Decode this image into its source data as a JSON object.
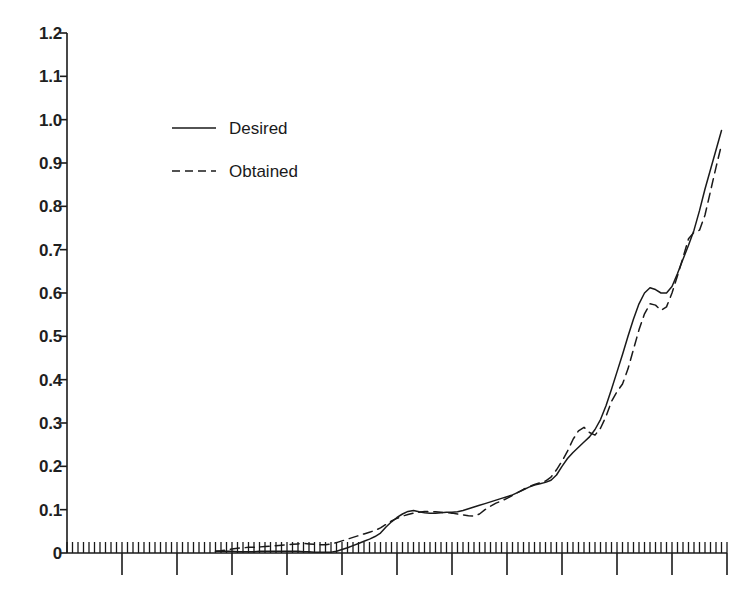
{
  "chart_data": {
    "type": "line",
    "title": "",
    "subtitle": "",
    "xlabel": "",
    "ylabel": "",
    "xlim": [
      0,
      120
    ],
    "ylim": [
      0,
      1.2
    ],
    "grid": false,
    "legend_position": "upper-left-inside",
    "y_ticks": [
      0,
      0.1,
      0.2,
      0.3,
      0.4,
      0.5,
      0.6,
      0.7,
      0.8,
      0.9,
      1.0,
      1.1,
      1.2
    ],
    "y_tick_labels": [
      "0",
      "0.1",
      "0.2",
      "0.3",
      "0.4",
      "0.5",
      "0.6",
      "0.7",
      "0.8",
      "0.9",
      "1.0",
      "1.1",
      "1.2"
    ],
    "x_ticks_major_count": 12,
    "x_minor_per_major": 10,
    "x_tick_labels": [],
    "axis_color": "#1a1a1a",
    "background_color": "#ffffff",
    "series": [
      {
        "name": "Desired",
        "style": "solid",
        "color": "#1a1a1a",
        "x": [
          27,
          28,
          29,
          30,
          31,
          32,
          33,
          34,
          35,
          36,
          37,
          38,
          39,
          40,
          41,
          42,
          43,
          44,
          45,
          46,
          47,
          48,
          49,
          50,
          51,
          52,
          53,
          54,
          55,
          56,
          57,
          58,
          59,
          60,
          61,
          62,
          63,
          64,
          65,
          66,
          67,
          68,
          69,
          70,
          71,
          72,
          73,
          74,
          75,
          76,
          77,
          78,
          79,
          80,
          81,
          82,
          83,
          84,
          85,
          86,
          87,
          88,
          89,
          90,
          91,
          92,
          93,
          94,
          95,
          96,
          97,
          98,
          99,
          100,
          101,
          102,
          103,
          104,
          105,
          106,
          107,
          108,
          109,
          110,
          111,
          112,
          113,
          114,
          115,
          116,
          117,
          118,
          119
        ],
        "y": [
          0.004,
          0.004,
          0.004,
          0.004,
          0.003,
          0.003,
          0.003,
          0.003,
          0.004,
          0.004,
          0.004,
          0.004,
          0.004,
          0.004,
          0.004,
          0.004,
          0.003,
          0.003,
          0.002,
          0.002,
          0.002,
          0.002,
          0.004,
          0.008,
          0.012,
          0.017,
          0.022,
          0.027,
          0.032,
          0.038,
          0.046,
          0.06,
          0.072,
          0.082,
          0.09,
          0.096,
          0.098,
          0.095,
          0.093,
          0.092,
          0.092,
          0.093,
          0.094,
          0.094,
          0.095,
          0.098,
          0.102,
          0.106,
          0.11,
          0.114,
          0.118,
          0.122,
          0.126,
          0.13,
          0.134,
          0.14,
          0.146,
          0.152,
          0.157,
          0.16,
          0.163,
          0.168,
          0.18,
          0.2,
          0.218,
          0.232,
          0.244,
          0.256,
          0.268,
          0.285,
          0.308,
          0.34,
          0.378,
          0.418,
          0.458,
          0.5,
          0.54,
          0.575,
          0.6,
          0.612,
          0.608,
          0.6,
          0.6,
          0.615,
          0.645,
          0.678,
          0.71,
          0.745,
          0.79,
          0.84,
          0.885,
          0.93,
          0.975
        ]
      },
      {
        "name": "Obtained",
        "style": "dashed",
        "color": "#1a1a1a",
        "x": [
          27,
          28,
          29,
          30,
          31,
          32,
          33,
          34,
          35,
          36,
          37,
          38,
          39,
          40,
          41,
          42,
          43,
          44,
          45,
          46,
          47,
          48,
          49,
          50,
          51,
          52,
          53,
          54,
          55,
          56,
          57,
          58,
          59,
          60,
          61,
          62,
          63,
          64,
          65,
          66,
          67,
          68,
          69,
          70,
          71,
          72,
          73,
          74,
          75,
          76,
          77,
          78,
          79,
          80,
          81,
          82,
          83,
          84,
          85,
          86,
          87,
          88,
          89,
          90,
          91,
          92,
          93,
          94,
          95,
          96,
          97,
          98,
          99,
          100,
          101,
          102,
          103,
          104,
          105,
          106,
          107,
          108,
          109,
          110,
          111,
          112,
          113,
          114,
          115,
          116,
          117,
          118,
          119
        ],
        "y": [
          0.004,
          0.005,
          0.007,
          0.009,
          0.011,
          0.012,
          0.013,
          0.013,
          0.014,
          0.015,
          0.016,
          0.017,
          0.018,
          0.019,
          0.02,
          0.021,
          0.022,
          0.021,
          0.02,
          0.019,
          0.019,
          0.021,
          0.024,
          0.028,
          0.032,
          0.036,
          0.04,
          0.044,
          0.048,
          0.052,
          0.058,
          0.066,
          0.074,
          0.08,
          0.085,
          0.089,
          0.092,
          0.094,
          0.096,
          0.096,
          0.095,
          0.094,
          0.093,
          0.092,
          0.09,
          0.088,
          0.086,
          0.085,
          0.09,
          0.1,
          0.108,
          0.115,
          0.12,
          0.126,
          0.133,
          0.14,
          0.147,
          0.153,
          0.158,
          0.162,
          0.166,
          0.175,
          0.192,
          0.212,
          0.235,
          0.262,
          0.282,
          0.29,
          0.278,
          0.272,
          0.288,
          0.315,
          0.35,
          0.372,
          0.39,
          0.425,
          0.47,
          0.515,
          0.552,
          0.575,
          0.572,
          0.56,
          0.568,
          0.6,
          0.64,
          0.682,
          0.725,
          0.74,
          0.745,
          0.78,
          0.835,
          0.89,
          0.942
        ]
      }
    ]
  },
  "legend": {
    "items": [
      {
        "label": "Desired",
        "style": "solid"
      },
      {
        "label": "Obtained",
        "style": "dashed"
      }
    ]
  }
}
